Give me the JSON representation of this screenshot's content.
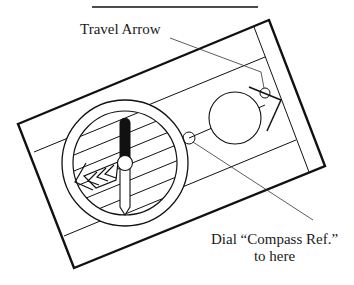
{
  "diagram": {
    "labels": {
      "travel_arrow": "Travel Arrow",
      "dial_line1": "Dial “Compass Ref.”",
      "dial_line2": "to here"
    },
    "colors": {
      "ink": "#111111",
      "background": "#ffffff"
    },
    "components": [
      "top-rule",
      "baseplate",
      "compass-housing",
      "rotating-dial",
      "magnetic-needle",
      "orienting-arrow",
      "magnifier-circle",
      "travel-arrow",
      "index-mark"
    ]
  }
}
